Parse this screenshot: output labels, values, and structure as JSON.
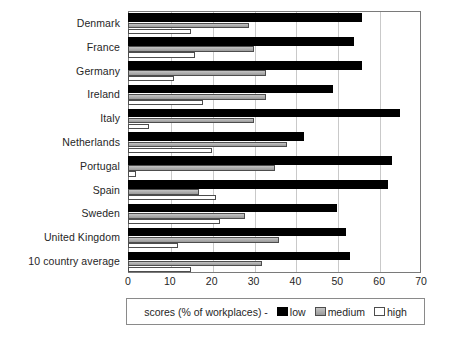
{
  "chart_data": {
    "type": "bar",
    "orientation": "horizontal",
    "title": "",
    "xlabel": "",
    "ylabel": "",
    "xlim": [
      0,
      70
    ],
    "xticks": [
      0,
      10,
      20,
      30,
      40,
      50,
      60,
      70
    ],
    "grid": true,
    "legend_position": "bottom",
    "legend_title": "scores (% of workplaces) -",
    "categories": [
      "Denmark",
      "France",
      "Germany",
      "Ireland",
      "Italy",
      "Netherlands",
      "Portugal",
      "Spain",
      "Sweden",
      "United Kingdom",
      "10 country average"
    ],
    "series": [
      {
        "name": "low",
        "color": "#000000",
        "values": [
          56,
          54,
          56,
          49,
          65,
          42,
          63,
          62,
          50,
          52,
          53
        ]
      },
      {
        "name": "medium",
        "color": "#a8a8a8",
        "values": [
          29,
          30,
          33,
          33,
          30,
          38,
          35,
          17,
          28,
          36,
          32
        ]
      },
      {
        "name": "high",
        "color": "#ffffff",
        "values": [
          15,
          16,
          11,
          18,
          5,
          20,
          2,
          21,
          22,
          12,
          15
        ]
      }
    ]
  }
}
